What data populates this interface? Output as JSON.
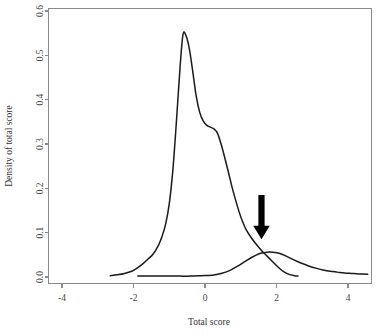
{
  "chart_data": {
    "type": "line",
    "title": "",
    "xlabel": "Total score",
    "ylabel": "Density of total score",
    "xlim": [
      -4.8,
      4.65
    ],
    "ylim": [
      0.0,
      0.625
    ],
    "grid": false,
    "legend": "none",
    "xticks": [
      "-4",
      "-2",
      "0",
      "2",
      "4"
    ],
    "xtick_values": [
      -4,
      -2,
      0,
      2,
      4
    ],
    "yticks": [
      "0.0",
      "0.1",
      "0.2",
      "0.3",
      "0.4",
      "0.5",
      "0.6"
    ],
    "ytick_values": [
      0.0,
      0.1,
      0.2,
      0.3,
      0.4,
      0.5,
      0.6
    ],
    "series": [
      {
        "name": "Non-case density",
        "x": [
          -2.65,
          -2.45,
          -2.25,
          -2.05,
          -1.9,
          -1.75,
          -1.6,
          -1.45,
          -1.3,
          -1.2,
          -1.1,
          -1.0,
          -0.9,
          -0.8,
          -0.7,
          -0.62,
          -0.55,
          -0.45,
          -0.35,
          -0.25,
          -0.15,
          -0.05,
          0.05,
          0.15,
          0.25,
          0.35,
          0.45,
          0.55,
          0.65,
          0.75,
          0.85,
          0.95,
          1.05,
          1.15,
          1.3,
          1.45,
          1.6,
          1.75,
          1.9,
          2.05,
          2.2,
          2.35,
          2.5,
          2.6
        ],
        "y": [
          0.003,
          0.005,
          0.008,
          0.013,
          0.02,
          0.029,
          0.04,
          0.052,
          0.072,
          0.092,
          0.12,
          0.165,
          0.24,
          0.35,
          0.47,
          0.545,
          0.548,
          0.52,
          0.468,
          0.41,
          0.372,
          0.352,
          0.342,
          0.338,
          0.334,
          0.324,
          0.3,
          0.27,
          0.238,
          0.205,
          0.175,
          0.148,
          0.125,
          0.107,
          0.088,
          0.072,
          0.058,
          0.046,
          0.034,
          0.022,
          0.012,
          0.006,
          0.003,
          0.002
        ]
      },
      {
        "name": "Case density",
        "x": [
          -1.88,
          -1.6,
          -1.3,
          -1.0,
          -0.7,
          -0.4,
          -0.1,
          0.2,
          0.45,
          0.7,
          0.9,
          1.1,
          1.3,
          1.5,
          1.65,
          1.8,
          1.95,
          2.1,
          2.3,
          2.5,
          2.7,
          2.9,
          3.1,
          3.3,
          3.5,
          3.7,
          3.9,
          4.1,
          4.3,
          4.55
        ],
        "y": [
          0.002,
          0.002,
          0.002,
          0.002,
          0.002,
          0.002,
          0.003,
          0.004,
          0.008,
          0.015,
          0.024,
          0.034,
          0.044,
          0.052,
          0.055,
          0.0565,
          0.0555,
          0.053,
          0.046,
          0.038,
          0.031,
          0.025,
          0.02,
          0.016,
          0.013,
          0.011,
          0.009,
          0.008,
          0.007,
          0.006
        ]
      }
    ],
    "annotations": [
      {
        "name": "cutoff-arrow",
        "shape": "down-arrow",
        "x": 1.58,
        "y_top": 0.185,
        "y_tip": 0.085,
        "color": "#000000"
      }
    ]
  }
}
